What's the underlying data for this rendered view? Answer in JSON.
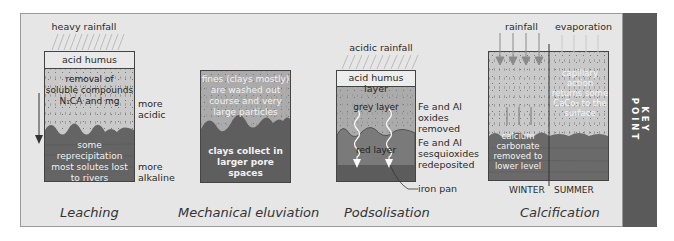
{
  "key_point": {
    "line1": "KEY",
    "line2": "POINT",
    "band_color": "#5a5a5a"
  },
  "leaching": {
    "title": "Leaching",
    "rain_label": "heavy rainfall",
    "top_layer": "acid humus",
    "mid_text": [
      "removal of",
      "soluble compounds",
      "N₁CA and mg"
    ],
    "low_text": [
      "some",
      "reprecipitation",
      "most solutes lost",
      "to rivers"
    ],
    "side_top": [
      "more",
      "acidic"
    ],
    "side_bottom": [
      "more",
      "alkaline"
    ]
  },
  "eluviation": {
    "title": "Mechanical eluviation",
    "upper_text": [
      "fines (clays mostly)",
      "are washed out",
      "course and very",
      "large particles"
    ],
    "lower_text": [
      "clays collect in",
      "larger pore",
      "spaces"
    ]
  },
  "podsolisation": {
    "title": "Podsolisation",
    "rain_label": "acidic rainfall",
    "top_layer": "acid humus layer",
    "grey_layer": "grey layer",
    "red_layer": "red layer",
    "side_top": [
      "Fe and Al",
      "oxides",
      "removed"
    ],
    "side_mid": [
      "Fe and Al",
      "sesquioxides",
      "redeposited"
    ],
    "pointer_label": "iron pan"
  },
  "calcification": {
    "title": "Calcification",
    "rain_label": "rainfall",
    "evap_label": "evaporation",
    "right_text": [
      "capillary action",
      "returns some",
      "CaCo₃ to the",
      "surface"
    ],
    "left_low_text": [
      "calcium",
      "carbonate",
      "removed to",
      "lower level"
    ],
    "winter_label": "WINTER",
    "summer_label": "SUMMER"
  },
  "colors": {
    "panel_bg": "#e6e6e6",
    "light_soil": "#c9c9c9",
    "mid_soil": "#9e9e9e",
    "dark_soil": "#616161",
    "humus": "#e9e9e9"
  }
}
